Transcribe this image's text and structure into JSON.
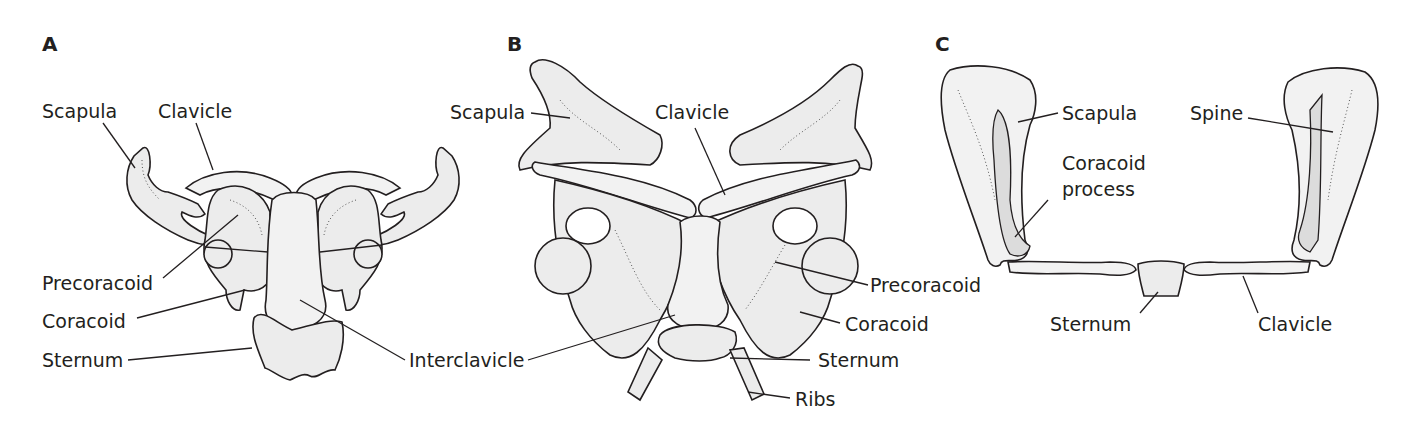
{
  "figure": {
    "panels": [
      {
        "id": "A",
        "letter": "A",
        "labels": {
          "scapula": "Scapula",
          "clavicle": "Clavicle",
          "precoracoid": "Precoracoid",
          "coracoid": "Coracoid",
          "sternum": "Sternum",
          "interclavicle": "Interclavicle"
        }
      },
      {
        "id": "B",
        "letter": "B",
        "labels": {
          "scapula": "Scapula",
          "clavicle": "Clavicle",
          "precoracoid": "Precoracoid",
          "coracoid": "Coracoid",
          "sternum": "Sternum",
          "ribs": "Ribs"
        }
      },
      {
        "id": "C",
        "letter": "C",
        "labels": {
          "scapula": "Scapula",
          "spine": "Spine",
          "coracoid_process_line1": "Coracoid",
          "coracoid_process_line2": "process",
          "sternum": "Sternum",
          "clavicle": "Clavicle"
        }
      }
    ],
    "colors": {
      "ink": "#231f20",
      "bone_fill": "#ececec",
      "bone_shade": "#dcdcdc",
      "background": "#ffffff"
    }
  }
}
